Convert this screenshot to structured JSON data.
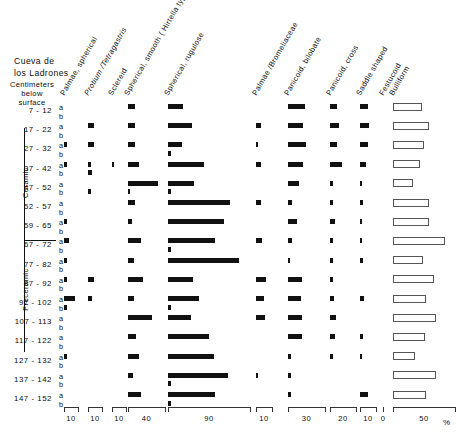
{
  "site": {
    "title_line1": "Cueva de",
    "title_line2": "los Ladrones",
    "axis_caption_line1": "Centimeters",
    "axis_caption_line2": "below",
    "axis_caption_line3": "surface"
  },
  "periods": [
    {
      "label": "Ceramic",
      "from_row": 0,
      "to_row": 6
    },
    {
      "label": "Preceramic",
      "from_row": 7,
      "to_row": 15
    }
  ],
  "sub_rows": [
    "a",
    "b"
  ],
  "percent_symbol": "%",
  "chart_data": {
    "type": "bar",
    "xlabel": "%",
    "ylabel": "Centimeters below surface",
    "grid": false,
    "legend": "none",
    "orientation": "horizontal",
    "categories": [
      "7 - 12",
      "17 - 22",
      "27 - 32",
      "37 - 42",
      "47 - 52",
      "52 - 57",
      "59 - 65",
      "67 - 72",
      "77 - 82",
      "87 - 92",
      "97 - 102",
      "107 - 113",
      "117 - 122",
      "127 - 132",
      "137 - 142",
      "147 - 152"
    ],
    "columns": [
      {
        "name": "Palmae, spherical",
        "italic": false,
        "axis_max": 10,
        "axis_label": "10",
        "x0": 64,
        "x1": 78
      },
      {
        "name": "Protium /Tetragastris",
        "italic": true,
        "axis_max": 10,
        "axis_label": "10",
        "x0": 88,
        "x1": 102
      },
      {
        "name": "Sclereid",
        "italic": false,
        "axis_max": 10,
        "axis_label": "10",
        "x0": 112,
        "x1": 126
      },
      {
        "name": "Spherical, smooth ( Hirtella type)",
        "italic": false,
        "axis_max": 40,
        "axis_label": "40",
        "x0": 128,
        "x1": 165
      },
      {
        "name": "Spherical, rugulose",
        "italic": false,
        "axis_max": 90,
        "axis_label": "90",
        "x0": 168,
        "x1": 250
      },
      {
        "name": "Palmae /Bromeliaceae",
        "italic": false,
        "axis_max": 10,
        "axis_label": "10",
        "x0": 256,
        "x1": 272
      },
      {
        "name": "Panicoid, bilobate",
        "italic": false,
        "axis_max": 30,
        "axis_label": "30",
        "x0": 288,
        "x1": 325
      },
      {
        "name": "Panicoid, cross",
        "italic": false,
        "axis_max": 20,
        "axis_label": "20",
        "x0": 330,
        "x1": 356
      },
      {
        "name": "Saddle shaped",
        "italic": false,
        "axis_max": 10,
        "axis_label": "10",
        "x0": 360,
        "x1": 376
      },
      {
        "name": "Festucoid",
        "italic": false,
        "axis_max": 0,
        "axis_label": "0",
        "x0": 383,
        "x1": 383
      },
      {
        "name": "Bulliform",
        "italic": false,
        "axis_max": 50,
        "axis_label": "50",
        "x0": 393,
        "x1": 455
      }
    ],
    "series": [
      {
        "name": "Palmae, spherical",
        "values_a": [
          0,
          0,
          2.0,
          2.0,
          0,
          0,
          2.0,
          3.5,
          2.0,
          2.0,
          7.5,
          0,
          0,
          1.8,
          0,
          0
        ],
        "values_b": [
          0,
          0,
          0,
          0,
          0,
          0,
          0,
          0,
          0,
          0,
          2.0,
          0,
          0,
          0,
          0,
          0
        ]
      },
      {
        "name": "Protium /Tetragastris",
        "values_a": [
          0,
          4.0,
          4.5,
          2.0,
          0,
          0,
          0,
          0,
          0,
          4.0,
          2.5,
          0,
          0,
          0,
          0,
          0
        ],
        "values_b": [
          0,
          0,
          0,
          2.5,
          2.0,
          0,
          0,
          0,
          0,
          0,
          0,
          0,
          0,
          0,
          0,
          0
        ]
      },
      {
        "name": "Sclereid",
        "values_a": [
          0,
          0,
          0,
          1.5,
          0,
          0,
          0,
          0,
          0,
          0,
          0,
          0,
          0,
          0,
          0,
          0
        ],
        "values_b": [
          0,
          0,
          0,
          0,
          0,
          0,
          0,
          0,
          0,
          0,
          0,
          0,
          0,
          0,
          0,
          0
        ]
      },
      {
        "name": "Spherical, smooth ( Hirtella type)",
        "values_a": [
          7.5,
          8.0,
          7.5,
          12.0,
          32.0,
          7.5,
          4.0,
          14.5,
          6.5,
          16.5,
          7.0,
          26.0,
          9.0,
          12.0,
          5.5,
          14.0
        ],
        "values_b": [
          0,
          0,
          0,
          0,
          2.0,
          0,
          0,
          0,
          0,
          0,
          0,
          0,
          0,
          0,
          0,
          0
        ]
      },
      {
        "name": "Spherical, rugulose",
        "values_a": [
          16.0,
          26.0,
          15.0,
          40.0,
          29.0,
          68.0,
          62.0,
          52.0,
          78.0,
          27.0,
          34.0,
          25.0,
          45.0,
          50.0,
          66.0,
          52.0
        ],
        "values_b": [
          0,
          0,
          3.5,
          0,
          3.5,
          0,
          0,
          3.5,
          0,
          0,
          3.5,
          0,
          0,
          0,
          3.5,
          3.5
        ]
      },
      {
        "name": "Palmae /Bromeliaceae",
        "values_a": [
          0,
          3.0,
          1.5,
          3.0,
          0,
          3.0,
          0,
          4.0,
          0,
          6.5,
          5.0,
          5.5,
          0,
          0,
          1.5,
          0
        ],
        "values_b": [
          0,
          0,
          0,
          0,
          0,
          0,
          0,
          0,
          0,
          0,
          0,
          0,
          0,
          0,
          0,
          0
        ]
      },
      {
        "name": "Panicoid, bilobate",
        "values_a": [
          14.0,
          12.5,
          14.5,
          12.0,
          9.0,
          3.5,
          7.0,
          3.5,
          2.0,
          11.0,
          10.5,
          11.0,
          11.0,
          2.5,
          2.5,
          2.5
        ],
        "values_b": [
          0,
          0,
          0,
          0,
          0,
          0,
          0,
          0,
          0,
          0,
          0,
          0,
          0,
          0,
          0,
          0
        ]
      },
      {
        "name": "Panicoid, cross",
        "values_a": [
          5.0,
          7.0,
          5.5,
          9.5,
          2.5,
          2.0,
          4.0,
          2.0,
          2.0,
          2.5,
          3.0,
          4.5,
          3.5,
          2.0,
          0,
          0
        ],
        "values_b": [
          0,
          0,
          0,
          0,
          0,
          0,
          0,
          0,
          0,
          0,
          0,
          0,
          0,
          0,
          0,
          0
        ]
      },
      {
        "name": "Saddle shaped",
        "values_a": [
          5.0,
          5.5,
          5.0,
          3.5,
          1.5,
          2.0,
          1.5,
          1.5,
          2.0,
          0,
          2.5,
          0,
          2.0,
          1.5,
          0,
          5.0
        ],
        "values_b": [
          0,
          0,
          0,
          0,
          0,
          0,
          0,
          0,
          0,
          0,
          0,
          0,
          0,
          0,
          0,
          0
        ]
      },
      {
        "name": "Festucoid",
        "values_a": [
          0,
          0,
          0,
          0,
          0,
          0,
          0,
          0,
          0,
          0,
          0,
          0,
          0,
          0,
          0,
          0
        ],
        "values_b": [
          0,
          0,
          0,
          0,
          0,
          0,
          0,
          0,
          0,
          0,
          0,
          0,
          0,
          0,
          0,
          0
        ]
      },
      {
        "name": "Bulliform",
        "values_a": [
          23.0,
          29.0,
          25.0,
          22.0,
          16.0,
          29.0,
          29.0,
          42.0,
          24.0,
          33.0,
          27.0,
          35.0,
          26.0,
          18.0,
          35.0,
          27.0
        ],
        "values_b": [
          0,
          0,
          0,
          0,
          0,
          0,
          0,
          0,
          0,
          0,
          0,
          0,
          0,
          0,
          0,
          0
        ]
      }
    ],
    "axis_ticks": [
      {
        "label": "10",
        "x0": 64,
        "x1": 78
      },
      {
        "label": "10",
        "x0": 88,
        "x1": 102
      },
      {
        "label": "10",
        "x0": 112,
        "x1": 126
      },
      {
        "label": "40",
        "x0": 128,
        "x1": 165
      },
      {
        "label": "90",
        "x0": 168,
        "x1": 250
      },
      {
        "label": "10",
        "x0": 256,
        "x1": 272
      },
      {
        "label": "30",
        "x0": 288,
        "x1": 325
      },
      {
        "label": "20",
        "x0": 330,
        "x1": 356
      },
      {
        "label": "10",
        "x0": 360,
        "x1": 376
      },
      {
        "label": "0",
        "x0": 383,
        "x1": 383
      },
      {
        "label": "50",
        "x0": 393,
        "x1": 455
      }
    ]
  }
}
